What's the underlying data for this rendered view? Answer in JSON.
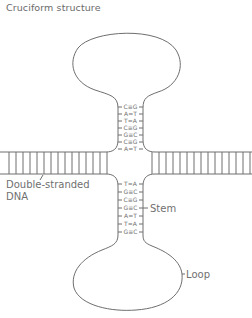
{
  "title": "Cruciform structure",
  "labels": {
    "dna": [
      "Double-stranded",
      "DNA"
    ],
    "stem": "Stem",
    "loop": "Loop"
  },
  "upper_stem_pairs": [
    "C≡G",
    "A=T",
    "T=A",
    "C≡G",
    "G≡C",
    "C≡G",
    "A=T"
  ],
  "lower_stem_pairs": [
    "T=A",
    "G≡C",
    "C≡G",
    "G≡C",
    "A=T",
    "T=A",
    "G≡C"
  ],
  "colors": {
    "line": "#6e6e6e",
    "text": "#707070"
  }
}
